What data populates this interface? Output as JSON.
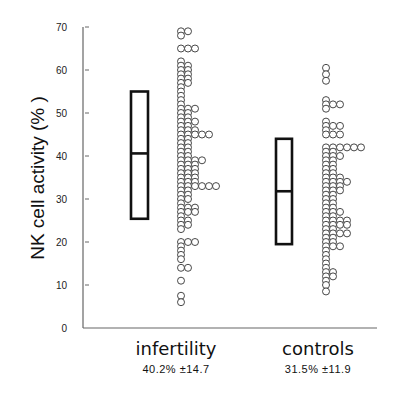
{
  "chart_data": {
    "type": "scatter",
    "subtype": "dot-plot-with-box",
    "title": "",
    "xlabel": "",
    "ylabel": "NK cell activity (% )",
    "ylim": [
      0,
      70
    ],
    "yticks": [
      0,
      10,
      20,
      30,
      40,
      50,
      60,
      70
    ],
    "grid": false,
    "legend": null,
    "categories": [
      "infertility",
      "controls"
    ],
    "groups": [
      {
        "name": "infertility",
        "summary": "40.2%  ±14.7",
        "mean": 40.2,
        "sd": 14.7,
        "box": {
          "low": 25.4,
          "median": 40.6,
          "high": 55.0
        },
        "dot_rows": [
          {
            "value": 69,
            "count": 2
          },
          {
            "value": 68,
            "count": 1
          },
          {
            "value": 65,
            "count": 3
          },
          {
            "value": 62,
            "count": 1
          },
          {
            "value": 61,
            "count": 2
          },
          {
            "value": 60,
            "count": 2
          },
          {
            "value": 59,
            "count": 2
          },
          {
            "value": 58,
            "count": 2
          },
          {
            "value": 57,
            "count": 2
          },
          {
            "value": 56,
            "count": 1
          },
          {
            "value": 55,
            "count": 1
          },
          {
            "value": 54,
            "count": 1
          },
          {
            "value": 53,
            "count": 1
          },
          {
            "value": 52,
            "count": 1
          },
          {
            "value": 51,
            "count": 3
          },
          {
            "value": 50,
            "count": 2
          },
          {
            "value": 49,
            "count": 2
          },
          {
            "value": 48,
            "count": 3
          },
          {
            "value": 47,
            "count": 2
          },
          {
            "value": 46,
            "count": 3
          },
          {
            "value": 45,
            "count": 5
          },
          {
            "value": 44,
            "count": 2
          },
          {
            "value": 43,
            "count": 2
          },
          {
            "value": 42,
            "count": 2
          },
          {
            "value": 41,
            "count": 2
          },
          {
            "value": 40,
            "count": 2
          },
          {
            "value": 39,
            "count": 4
          },
          {
            "value": 38,
            "count": 3
          },
          {
            "value": 37,
            "count": 3
          },
          {
            "value": 36,
            "count": 3
          },
          {
            "value": 35,
            "count": 3
          },
          {
            "value": 34,
            "count": 3
          },
          {
            "value": 33,
            "count": 6
          },
          {
            "value": 32,
            "count": 2
          },
          {
            "value": 31,
            "count": 2
          },
          {
            "value": 30,
            "count": 2
          },
          {
            "value": 29,
            "count": 1
          },
          {
            "value": 28,
            "count": 3
          },
          {
            "value": 27,
            "count": 3
          },
          {
            "value": 26,
            "count": 1
          },
          {
            "value": 25,
            "count": 2
          },
          {
            "value": 24,
            "count": 2
          },
          {
            "value": 23,
            "count": 1
          },
          {
            "value": 20,
            "count": 3
          },
          {
            "value": 19,
            "count": 1
          },
          {
            "value": 18,
            "count": 1
          },
          {
            "value": 17,
            "count": 1
          },
          {
            "value": 16,
            "count": 1
          },
          {
            "value": 14,
            "count": 2
          },
          {
            "value": 11,
            "count": 1
          },
          {
            "value": 7.5,
            "count": 1
          },
          {
            "value": 6,
            "count": 1
          }
        ]
      },
      {
        "name": "controls",
        "summary": "31.5%  ±11.9",
        "mean": 31.5,
        "sd": 11.9,
        "box": {
          "low": 19.5,
          "median": 31.8,
          "high": 44.0
        },
        "dot_rows": [
          {
            "value": 60.5,
            "count": 1
          },
          {
            "value": 59,
            "count": 1
          },
          {
            "value": 57.5,
            "count": 1
          },
          {
            "value": 53,
            "count": 1
          },
          {
            "value": 52,
            "count": 3
          },
          {
            "value": 51,
            "count": 1
          },
          {
            "value": 48,
            "count": 1
          },
          {
            "value": 47,
            "count": 3
          },
          {
            "value": 46,
            "count": 1
          },
          {
            "value": 45,
            "count": 3
          },
          {
            "value": 42,
            "count": 6
          },
          {
            "value": 41,
            "count": 2
          },
          {
            "value": 40,
            "count": 3
          },
          {
            "value": 39,
            "count": 2
          },
          {
            "value": 38,
            "count": 2
          },
          {
            "value": 37,
            "count": 2
          },
          {
            "value": 36,
            "count": 2
          },
          {
            "value": 35,
            "count": 3
          },
          {
            "value": 34,
            "count": 4
          },
          {
            "value": 33,
            "count": 3
          },
          {
            "value": 32,
            "count": 3
          },
          {
            "value": 31,
            "count": 2
          },
          {
            "value": 30,
            "count": 2
          },
          {
            "value": 29,
            "count": 2
          },
          {
            "value": 28,
            "count": 2
          },
          {
            "value": 27,
            "count": 3
          },
          {
            "value": 26,
            "count": 2
          },
          {
            "value": 25,
            "count": 4
          },
          {
            "value": 24,
            "count": 4
          },
          {
            "value": 23,
            "count": 2
          },
          {
            "value": 22,
            "count": 4
          },
          {
            "value": 21,
            "count": 2
          },
          {
            "value": 20,
            "count": 2
          },
          {
            "value": 19,
            "count": 3
          },
          {
            "value": 18,
            "count": 1
          },
          {
            "value": 17,
            "count": 1
          },
          {
            "value": 16,
            "count": 1
          },
          {
            "value": 15,
            "count": 1
          },
          {
            "value": 14,
            "count": 1
          },
          {
            "value": 13,
            "count": 2
          },
          {
            "value": 12,
            "count": 2
          },
          {
            "value": 11,
            "count": 1
          },
          {
            "value": 10,
            "count": 1
          },
          {
            "value": 8.5,
            "count": 1
          }
        ]
      }
    ]
  },
  "layout": {
    "plot": {
      "x_axis_x": 83,
      "y_zero_px": 328,
      "y_top_px": 27,
      "x_end_px": 377
    },
    "groups": [
      {
        "box_x": 131,
        "box_w": 17,
        "dots_x": 181,
        "label_x": 176,
        "label_y": 340,
        "stat_y": 368
      },
      {
        "box_x": 276,
        "box_w": 16,
        "dots_x": 326,
        "label_x": 318,
        "label_y": 340,
        "stat_y": 368
      }
    ],
    "dot_r": 3.5,
    "dot_dx": 7,
    "colors": {
      "axis": "#666666",
      "box": "#111111",
      "dot_stroke": "#333333",
      "dot_fill": "#ffffff"
    }
  }
}
